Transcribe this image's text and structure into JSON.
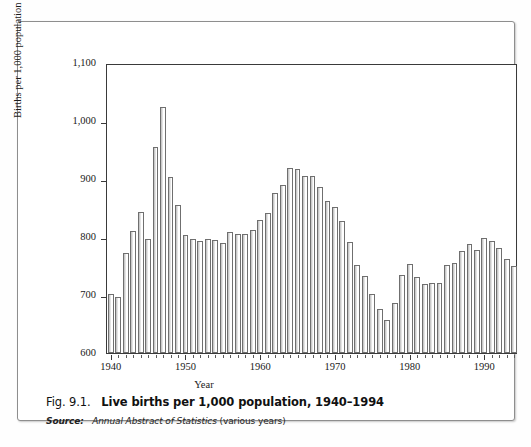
{
  "caption": {
    "fig_number": "Fig. 9.1.",
    "title": "Live births per 1,000 population, 1940–1994",
    "source_label": "Source:",
    "source_publication": "Annual Abstract of Statistics",
    "source_note": "(various years)"
  },
  "chart_data": {
    "type": "bar",
    "title": "Live births per 1,000 population, 1940–1994",
    "xlabel": "Year",
    "ylabel": "Births per 1,000 population",
    "ylim": [
      600,
      1100
    ],
    "yticks": [
      600,
      700,
      800,
      900,
      1000,
      1100
    ],
    "ytick_labels": [
      "600",
      "700",
      "800",
      "900",
      "1,000",
      "1,100"
    ],
    "xlim": [
      1939.5,
      1994.5
    ],
    "xticks": [
      1940,
      1950,
      1960,
      1970,
      1980,
      1990
    ],
    "xtick_labels": [
      "1940",
      "1950",
      "1960",
      "1970",
      "1980",
      "1990"
    ],
    "grid": false,
    "legend": null,
    "bar_facecolor": "#ffffff",
    "bar_edgecolor": "#6f6f6f",
    "categories": [
      1940,
      1941,
      1942,
      1943,
      1944,
      1945,
      1946,
      1947,
      1948,
      1949,
      1950,
      1951,
      1952,
      1953,
      1954,
      1955,
      1956,
      1957,
      1958,
      1959,
      1960,
      1961,
      1962,
      1963,
      1964,
      1965,
      1966,
      1967,
      1968,
      1969,
      1970,
      1971,
      1972,
      1973,
      1974,
      1975,
      1976,
      1977,
      1978,
      1979,
      1980,
      1981,
      1982,
      1983,
      1984,
      1985,
      1986,
      1987,
      1988,
      1989,
      1990,
      1991,
      1992,
      1993,
      1994
    ],
    "values": [
      702,
      696,
      772,
      811,
      843,
      796,
      956,
      1025,
      903,
      855,
      803,
      797,
      793,
      797,
      795,
      789,
      808,
      805,
      806,
      812,
      829,
      841,
      876,
      890,
      919,
      918,
      906,
      906,
      887,
      862,
      852,
      828,
      792,
      752,
      733,
      702,
      676,
      657,
      687,
      734,
      754,
      731,
      719,
      721,
      720,
      751,
      755,
      776,
      788,
      777,
      799,
      793,
      781,
      762,
      750
    ]
  }
}
